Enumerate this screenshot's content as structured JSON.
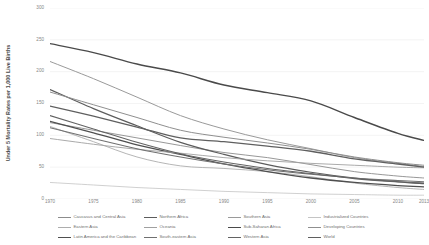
{
  "chart_data": {
    "type": "line",
    "title": "",
    "xlabel": "",
    "ylabel": "Under 5 Mortality Rates per 1,000 Live Births",
    "x": [
      1970,
      1975,
      1980,
      1985,
      1990,
      1995,
      2000,
      2005,
      2010,
      2013
    ],
    "xlim": [
      1970,
      2013
    ],
    "ylim": [
      0,
      300
    ],
    "y_ticks": [
      0,
      50,
      100,
      150,
      200,
      250,
      300
    ],
    "x_ticks": [
      1970,
      1975,
      1980,
      1985,
      1990,
      1995,
      2000,
      2005,
      2010,
      2013
    ],
    "grid": true,
    "legend_position": "bottom",
    "series": [
      {
        "name": "Caucasus and Central Asia",
        "color": "#8c8c8c",
        "width": 0.9,
        "values": [
          120,
          108,
          96,
          84,
          73,
          65,
          54,
          43,
          36,
          33
        ]
      },
      {
        "name": "Eastern Asia",
        "color": "#adadad",
        "width": 0.9,
        "values": [
          114,
          90,
          66,
          52,
          48,
          43,
          35,
          25,
          18,
          15
        ]
      },
      {
        "name": "Latin America and the Caribbean",
        "color": "#4f4f4f",
        "width": 1.3,
        "values": [
          122,
          104,
          85,
          70,
          55,
          43,
          33,
          26,
          21,
          19
        ]
      },
      {
        "name": "Northern Africa",
        "color": "#5c5c5c",
        "width": 1.2,
        "values": [
          172,
          142,
          115,
          89,
          70,
          54,
          42,
          33,
          27,
          24
        ]
      },
      {
        "name": "Oceania",
        "color": "#a0a0a0",
        "width": 0.9,
        "values": [
          95,
          86,
          78,
          72,
          65,
          60,
          56,
          53,
          50,
          49
        ]
      },
      {
        "name": "South-eastern Asia",
        "color": "#707070",
        "width": 1.1,
        "values": [
          112,
          95,
          79,
          66,
          55,
          46,
          39,
          33,
          29,
          27
        ]
      },
      {
        "name": "Southern Asia",
        "color": "#9a9a9a",
        "width": 1.0,
        "values": [
          216,
          189,
          160,
          131,
          110,
          93,
          79,
          65,
          56,
          51
        ]
      },
      {
        "name": "Sub-Saharan Africa",
        "color": "#4a4a4a",
        "width": 1.4,
        "values": [
          244,
          230,
          212,
          198,
          179,
          167,
          154,
          128,
          103,
          92
        ]
      },
      {
        "name": "Western Asia",
        "color": "#636363",
        "width": 1.1,
        "values": [
          131,
          110,
          89,
          71,
          58,
          48,
          40,
          32,
          27,
          25
        ]
      },
      {
        "name": "Industrialized Countries",
        "color": "#c4c4c4",
        "width": 0.8,
        "values": [
          26,
          22,
          18,
          15,
          12,
          10,
          8,
          7,
          6,
          6
        ]
      },
      {
        "name": "Developing Countries",
        "color": "#8f8f8f",
        "width": 1.0,
        "values": [
          168,
          148,
          128,
          108,
          97,
          88,
          78,
          66,
          57,
          53
        ]
      },
      {
        "name": "World",
        "color": "#5f5f5f",
        "width": 1.3,
        "values": [
          146,
          130,
          113,
          96,
          90,
          83,
          75,
          63,
          55,
          50
        ]
      }
    ]
  },
  "axis": {
    "y_title": "Under 5 Mortality Rates per 1,000 Live Births"
  }
}
